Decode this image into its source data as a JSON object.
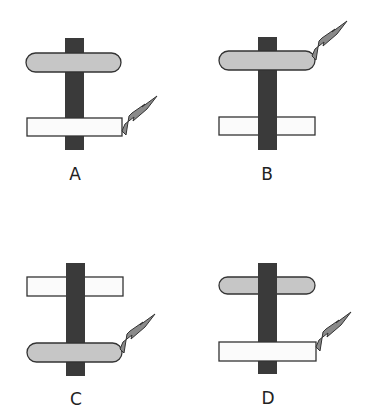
{
  "colors": {
    "background": "#ffffff",
    "shaft": "#3a3a3a",
    "oval_fill": "#c6c6c6",
    "rect_fill": "#fbfbfb",
    "outline": "#333333",
    "bolt_fill": "#8a8a8a"
  },
  "panels": [
    {
      "label": "A",
      "shaft": {
        "x": 65,
        "y": 38,
        "w": 19,
        "h": 112
      },
      "oval": {
        "x": 26,
        "y": 53,
        "w": 95,
        "h": 19,
        "in_front_of_shaft": true
      },
      "rect": {
        "x": 27,
        "y": 118,
        "w": 95,
        "h": 18,
        "in_front_of_shaft": true
      },
      "bolt_on": "rect",
      "bolt_base": {
        "x": 122,
        "y": 131
      },
      "label_pos": {
        "x": 60,
        "y": 165
      }
    },
    {
      "label": "B",
      "shaft": {
        "x": 258,
        "y": 37,
        "w": 19,
        "h": 113
      },
      "oval": {
        "x": 219,
        "y": 51,
        "w": 96,
        "h": 19,
        "in_front_of_shaft": true
      },
      "rect": {
        "x": 219,
        "y": 117,
        "w": 96,
        "h": 18,
        "in_front_of_shaft": false
      },
      "bolt_on": "oval",
      "bolt_base": {
        "x": 312,
        "y": 56
      },
      "label_pos": {
        "x": 252,
        "y": 165
      }
    },
    {
      "label": "C",
      "shaft": {
        "x": 66,
        "y": 263,
        "w": 19,
        "h": 113
      },
      "oval": {
        "x": 27,
        "y": 343,
        "w": 95,
        "h": 19,
        "in_front_of_shaft": true
      },
      "rect": {
        "x": 27,
        "y": 277,
        "w": 96,
        "h": 19,
        "in_front_of_shaft": false
      },
      "bolt_on": "oval",
      "bolt_base": {
        "x": 120,
        "y": 349
      },
      "label_pos": {
        "x": 61,
        "y": 390
      }
    },
    {
      "label": "D",
      "shaft": {
        "x": 258,
        "y": 263,
        "w": 19,
        "h": 111
      },
      "oval": {
        "x": 219,
        "y": 277,
        "w": 96,
        "h": 17,
        "in_front_of_shaft": false
      },
      "rect": {
        "x": 219,
        "y": 342,
        "w": 97,
        "h": 19,
        "in_front_of_shaft": true
      },
      "bolt_on": "rect",
      "bolt_base": {
        "x": 316,
        "y": 347
      },
      "label_pos": {
        "x": 253,
        "y": 389
      }
    }
  ]
}
